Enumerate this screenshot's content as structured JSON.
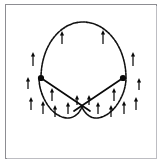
{
  "figure": {
    "kind": "geometric-diagram",
    "background_color": "#ffffff",
    "frame": {
      "border_color": "#8d8d92",
      "shadow_color": "#bdbdc2",
      "x": 5,
      "y": 4,
      "width": 152,
      "height": 155
    },
    "curve": {
      "name": "boundary-curve",
      "style": "dashed",
      "stroke_color": "#111111",
      "stroke_width": 1.6,
      "dash_pattern": "2.4 1.1",
      "path": "M 41 78 C 41 46, 60 22, 83 22 C 106 22, 126 46, 126 78 C 126 96, 112 118, 96 118 C 89 118, 84 112, 82 107 C 80 112, 75 118, 68 118 C 52 118, 39 96, 39 78 Z"
    },
    "chords": {
      "name": "crossing-segments",
      "stroke_color": "#0a0a0a",
      "stroke_width": 1.7,
      "segments": [
        {
          "name": "left-chord",
          "x1": 41,
          "y1": 78,
          "x2": 90,
          "y2": 111
        },
        {
          "name": "right-chord",
          "x1": 123,
          "y1": 78,
          "x2": 74,
          "y2": 111
        }
      ]
    },
    "points": [
      {
        "name": "left-point",
        "cx": 41,
        "cy": 78,
        "r": 3.1,
        "color": "#0a0a0a"
      },
      {
        "name": "right-point",
        "cx": 123,
        "cy": 78,
        "r": 3.1,
        "color": "#0a0a0a"
      }
    ],
    "vector_field": {
      "name": "upward-normal-arrows",
      "direction": "up",
      "count": 18,
      "stroke_color": "#0a0a0a",
      "arrows": [
        {
          "x": 62,
          "y_tail": 44,
          "y_tip": 31,
          "len": 13
        },
        {
          "x": 103,
          "y_tail": 44,
          "y_tip": 30,
          "len": 14
        },
        {
          "x": 33,
          "y_tail": 66,
          "y_tip": 52,
          "len": 14
        },
        {
          "x": 133,
          "y_tail": 66,
          "y_tip": 52,
          "len": 14
        },
        {
          "x": 28,
          "y_tail": 89,
          "y_tip": 77,
          "len": 12
        },
        {
          "x": 139,
          "y_tail": 90,
          "y_tip": 78,
          "len": 12
        },
        {
          "x": 31,
          "y_tail": 110,
          "y_tip": 97,
          "len": 13
        },
        {
          "x": 136,
          "y_tail": 110,
          "y_tip": 97,
          "len": 13
        },
        {
          "x": 43,
          "y_tail": 114,
          "y_tip": 101,
          "len": 13
        },
        {
          "x": 124,
          "y_tail": 114,
          "y_tip": 101,
          "len": 13
        },
        {
          "x": 52,
          "y_tail": 101,
          "y_tip": 88,
          "len": 13
        },
        {
          "x": 114,
          "y_tail": 101,
          "y_tip": 88,
          "len": 13
        },
        {
          "x": 55,
          "y_tail": 117,
          "y_tip": 105,
          "len": 12
        },
        {
          "x": 111,
          "y_tail": 117,
          "y_tip": 105,
          "len": 12
        },
        {
          "x": 68,
          "y_tail": 114,
          "y_tip": 102,
          "len": 12
        },
        {
          "x": 98,
          "y_tail": 114,
          "y_tip": 102,
          "len": 12
        },
        {
          "x": 77,
          "y_tail": 105,
          "y_tip": 95,
          "len": 10
        },
        {
          "x": 89,
          "y_tail": 105,
          "y_tip": 95,
          "len": 10
        }
      ]
    }
  }
}
